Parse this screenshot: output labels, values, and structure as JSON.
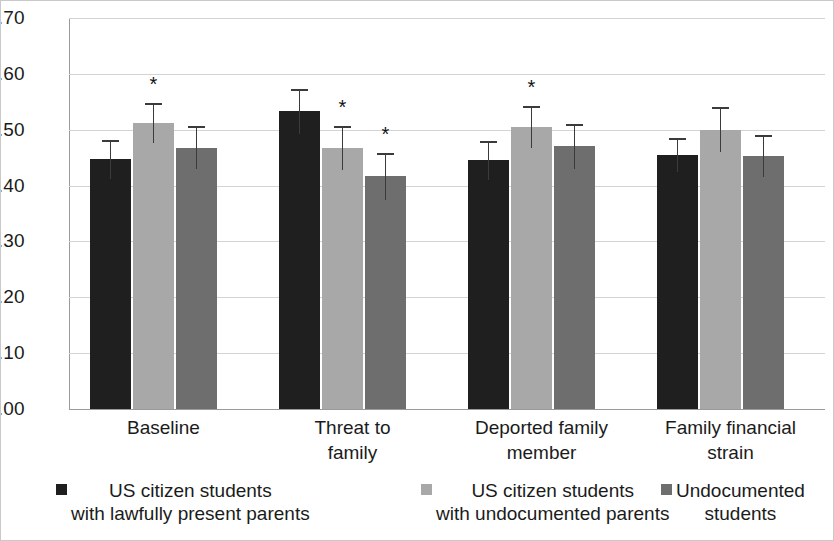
{
  "chart_data": {
    "type": "bar",
    "title": "",
    "xlabel": "",
    "ylabel": "",
    "ylim": [
      0.0,
      0.7
    ],
    "ytick_labels": [
      "0.70",
      "0.60",
      "0.50",
      "0.40",
      "0.30",
      "0.20",
      "0.10",
      "0.00"
    ],
    "ytick_values": [
      0.7,
      0.6,
      0.5,
      0.4,
      0.3,
      0.2,
      0.1,
      0.0
    ],
    "grid": "horizontal",
    "legend_position": "bottom",
    "error_bars": "95% CI",
    "annotation_symbol": "*",
    "categories": [
      "Baseline",
      "Threat to\nfamily",
      "Deported family\nmember",
      "Family financial\nstrain"
    ],
    "series": [
      {
        "name": "US citizen students\nwith lawfully present parents",
        "color": "#1f1f1f",
        "values": [
          0.447,
          0.533,
          0.445,
          0.455
        ],
        "err_low": [
          0.035,
          0.04,
          0.035,
          0.03
        ],
        "err_high": [
          0.035,
          0.04,
          0.035,
          0.03
        ],
        "significant": [
          false,
          false,
          false,
          false
        ]
      },
      {
        "name": "US citizen students\nwith undocumented parents",
        "color": "#a8a8a8",
        "values": [
          0.512,
          0.467,
          0.505,
          0.5
        ],
        "err_low": [
          0.035,
          0.04,
          0.038,
          0.04
        ],
        "err_high": [
          0.035,
          0.04,
          0.038,
          0.04
        ],
        "significant": [
          true,
          true,
          true,
          false
        ]
      },
      {
        "name": "Undocumented\nstudents",
        "color": "#6e6e6e",
        "values": [
          0.468,
          0.417,
          0.47,
          0.453
        ],
        "err_low": [
          0.038,
          0.042,
          0.04,
          0.038
        ],
        "err_high": [
          0.038,
          0.042,
          0.04,
          0.038
        ],
        "significant": [
          false,
          true,
          false,
          false
        ]
      }
    ]
  },
  "legend": {
    "items": [
      {
        "label": "US citizen students\nwith lawfully present parents",
        "color": "#1f1f1f"
      },
      {
        "label": "US citizen students\nwith undocumented parents",
        "color": "#a8a8a8"
      },
      {
        "label": "Undocumented\nstudents",
        "color": "#6e6e6e"
      }
    ]
  }
}
